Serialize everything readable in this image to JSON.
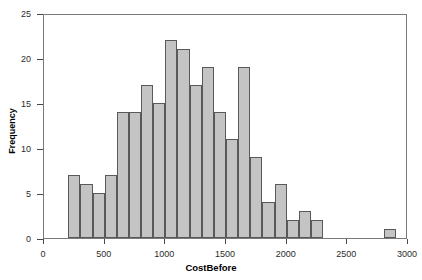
{
  "chart_data": {
    "type": "bar",
    "title": "",
    "subtitle": "",
    "xlabel": "CostBefore",
    "ylabel": "Frequency",
    "xlim": [
      0,
      3000
    ],
    "ylim": [
      0,
      25
    ],
    "grid": false,
    "legend": null,
    "bin_width": 100,
    "x_ticks": [
      0,
      500,
      1000,
      1500,
      2000,
      2500,
      3000
    ],
    "x_tick_labels": [
      "0",
      "500",
      "1000",
      "1500",
      "2000",
      "2500",
      "3000"
    ],
    "y_ticks": [
      0,
      5,
      10,
      15,
      20,
      25
    ],
    "y_tick_labels": [
      "0",
      "5",
      "10",
      "15",
      "20",
      "25"
    ],
    "bin_starts": [
      200,
      300,
      400,
      500,
      600,
      700,
      800,
      900,
      1000,
      1100,
      1200,
      1300,
      1400,
      1500,
      1600,
      1700,
      1800,
      1900,
      2000,
      2100,
      2200,
      2800
    ],
    "categories": [
      "200-300",
      "300-400",
      "400-500",
      "500-600",
      "600-700",
      "700-800",
      "800-900",
      "900-1000",
      "1000-1100",
      "1100-1200",
      "1200-1300",
      "1300-1400",
      "1400-1500",
      "1500-1600",
      "1600-1700",
      "1700-1800",
      "1800-1900",
      "1900-2000",
      "2000-2100",
      "2100-2200",
      "2200-2300",
      "2800-2900"
    ],
    "values": [
      7,
      6,
      5,
      7,
      14,
      14,
      17,
      15,
      22,
      21,
      17,
      19,
      14,
      11,
      19,
      9,
      4,
      6,
      2,
      3,
      2,
      1
    ],
    "bar_fill_color": "#c4c4c4",
    "bar_edge_color": "#59595c",
    "frame_color": "#7a7a7a",
    "background_color": "#ffffff"
  }
}
